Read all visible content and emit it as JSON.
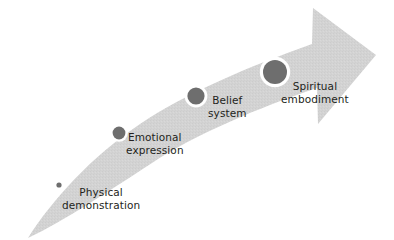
{
  "diagram": {
    "type": "curved-arrow-progression",
    "orientation": "ascending-left-to-right",
    "background_color": "#ffffff",
    "band_color": "#d2d2d2",
    "marker_color": "#6e6e6e",
    "marker_ring_color": "#ffffff",
    "text_color": "#231f20",
    "stages": [
      {
        "index": 1,
        "label_lines": [
          "Physical",
          "demonstration"
        ],
        "marker": {
          "cx": 59,
          "cy": 185,
          "r": 2.6,
          "ring": 1.6
        }
      },
      {
        "index": 2,
        "label_lines": [
          "Emotional",
          "expression"
        ],
        "marker": {
          "cx": 119,
          "cy": 133,
          "r": 6.4,
          "ring": 2.4
        }
      },
      {
        "index": 3,
        "label_lines": [
          "Belief",
          "system"
        ],
        "marker": {
          "cx": 196,
          "cy": 96,
          "r": 8.6,
          "ring": 2.8
        }
      },
      {
        "index": 4,
        "label_lines": [
          "Spiritual",
          "embodiment"
        ],
        "marker": {
          "cx": 275,
          "cy": 72,
          "r": 12.0,
          "ring": 3.2
        }
      }
    ]
  }
}
